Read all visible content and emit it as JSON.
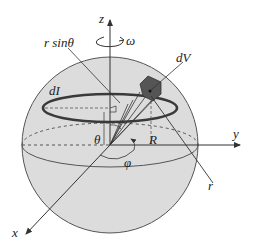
{
  "figure": {
    "colors": {
      "sphere_fill": "#d9d9d9",
      "line": "#333333",
      "ring": "#3a3a3a",
      "volume_element": "#555555",
      "background": "#ffffff"
    },
    "labels": {
      "z_axis": "z",
      "y_axis": "y",
      "x_axis": "x",
      "r_sin_theta": "r sinθ",
      "omega": "ω",
      "dV": "dV",
      "dI": "dI",
      "theta": "θ",
      "R": "R",
      "phi": "φ",
      "r": "r"
    }
  }
}
